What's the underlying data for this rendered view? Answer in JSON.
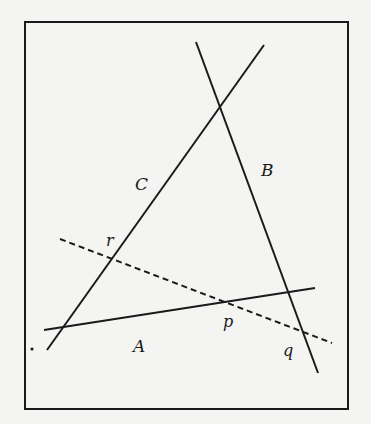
{
  "diagram": {
    "colors": {
      "ink": "#1a1a1a",
      "background": "#f4f4f2"
    },
    "frame": {
      "x": 25,
      "y": 22,
      "width": 323,
      "height": 387
    },
    "lines": [
      {
        "name": "A",
        "style": "solid",
        "x1": 44,
        "y1": 330,
        "x2": 315,
        "y2": 288
      },
      {
        "name": "B",
        "style": "solid",
        "x1": 196,
        "y1": 42,
        "x2": 318,
        "y2": 373
      },
      {
        "name": "C",
        "style": "solid",
        "x1": 47,
        "y1": 350,
        "x2": 264,
        "y2": 45
      },
      {
        "name": "transversal",
        "style": "dashed",
        "x1": 60,
        "y1": 239,
        "x2": 332,
        "y2": 343
      }
    ],
    "labels": {
      "line_A": "A",
      "line_B": "B",
      "line_C": "C",
      "point_p": "p",
      "point_q": "q",
      "point_r": "r",
      "stray_dot": "."
    }
  }
}
